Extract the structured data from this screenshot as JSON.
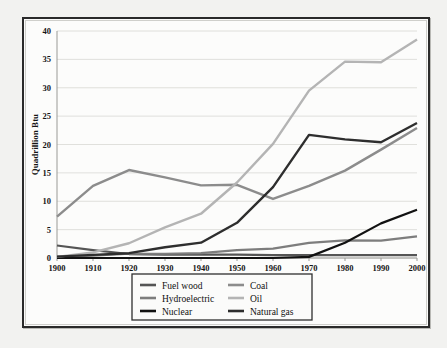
{
  "chart_data": {
    "type": "line",
    "title": "",
    "subtitle": "",
    "xlabel": "",
    "ylabel": "Quadrillion Btu",
    "x": [
      1900,
      1910,
      1920,
      1930,
      1940,
      1950,
      1960,
      1970,
      1980,
      1990,
      2000
    ],
    "categories": [
      "1900",
      "1910",
      "1920",
      "1930",
      "1940",
      "1950",
      "1960",
      "1970",
      "1980",
      "1990",
      "2000"
    ],
    "xlim": [
      1900,
      2000
    ],
    "ylim": [
      0,
      40
    ],
    "yticks": [
      0,
      5,
      10,
      15,
      20,
      25,
      30,
      35,
      40
    ],
    "ytick_labels": [
      "0",
      "5",
      "10",
      "15",
      "20",
      "25",
      "30",
      "35",
      "40"
    ],
    "xticks": [
      1900,
      1910,
      1920,
      1930,
      1940,
      1950,
      1960,
      1970,
      1980,
      1990,
      2000
    ],
    "xtick_labels": [
      "1900",
      "1910",
      "1920",
      "1930",
      "1940",
      "1950",
      "1960",
      "1970",
      "1980",
      "1990",
      "2000"
    ],
    "grid": "horizontal",
    "legend_position": "below-axes",
    "series": [
      {
        "name": "Fuel wood",
        "color": "#555555",
        "width": 2.2,
        "values": [
          2.2,
          1.4,
          0.7,
          0.6,
          0.6,
          0.6,
          0.5,
          0.5,
          0.5,
          0.5,
          0.5
        ]
      },
      {
        "name": "Hydroelectric",
        "color": "#7d7d7d",
        "width": 2.2,
        "values": [
          0.25,
          0.4,
          0.75,
          0.75,
          0.85,
          1.4,
          1.65,
          2.65,
          3.1,
          3.05,
          3.8
        ]
      },
      {
        "name": "Nuclear",
        "color": "#121212",
        "width": 2.2,
        "values": [
          0,
          0,
          0,
          0,
          0,
          0,
          0,
          0.2,
          2.7,
          6.1,
          8.5
        ]
      },
      {
        "name": "Coal",
        "color": "#8c8c8c",
        "width": 2.4,
        "values": [
          7.3,
          12.7,
          15.5,
          14.2,
          12.8,
          12.9,
          10.4,
          12.7,
          15.4,
          19.1,
          22.9
        ]
      },
      {
        "name": "Oil",
        "color": "#b4b4b4",
        "width": 2.4,
        "values": [
          0.2,
          1.0,
          2.6,
          5.4,
          7.8,
          13.3,
          20.1,
          29.5,
          34.6,
          34.5,
          38.5
        ]
      },
      {
        "name": "Natural gas",
        "color": "#2e2e2e",
        "width": 2.4,
        "values": [
          0.25,
          0.55,
          0.85,
          1.9,
          2.7,
          6.2,
          12.5,
          21.7,
          20.9,
          20.4,
          23.8
        ]
      }
    ],
    "legend_entries": [
      {
        "label": "Fuel wood",
        "color": "#555555",
        "column": 0,
        "row": 0
      },
      {
        "label": "Hydroelectric",
        "color": "#7d7d7d",
        "column": 0,
        "row": 1
      },
      {
        "label": "Nuclear",
        "color": "#121212",
        "column": 0,
        "row": 2
      },
      {
        "label": "Coal",
        "color": "#8c8c8c",
        "column": 1,
        "row": 0
      },
      {
        "label": "Oil",
        "color": "#b4b4b4",
        "column": 1,
        "row": 1
      },
      {
        "label": "Natural gas",
        "color": "#2e2e2e",
        "column": 1,
        "row": 2
      }
    ]
  }
}
